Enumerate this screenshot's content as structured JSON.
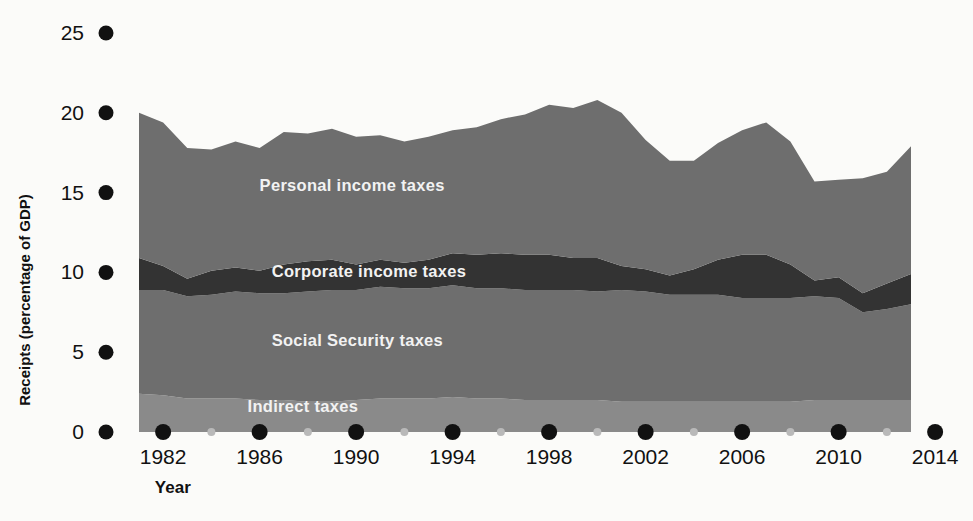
{
  "chart_data": {
    "type": "area",
    "stacked": true,
    "title": "",
    "xlabel": "Year",
    "ylabel": "Receipts (percentage of GDP)",
    "xlim": [
      1981,
      2014
    ],
    "ylim": [
      0,
      25
    ],
    "ytick_values": [
      0,
      5,
      10,
      15,
      20,
      25
    ],
    "ytick_labels": [
      "0",
      "5",
      "10",
      "15",
      "20",
      "25"
    ],
    "xtick_major_values": [
      1982,
      1986,
      1990,
      1994,
      1998,
      2002,
      2006,
      2010,
      2014
    ],
    "xtick_major_labels": [
      "1982",
      "1986",
      "1990",
      "1994",
      "1998",
      "2002",
      "2006",
      "2010",
      "2014"
    ],
    "xtick_minor_values": [
      1984,
      1988,
      1992,
      1996,
      2000,
      2004,
      2008,
      2012
    ],
    "grid": false,
    "legend_position": "inline-labels",
    "tick_style": "dots",
    "x": [
      1981,
      1982,
      1983,
      1984,
      1985,
      1986,
      1987,
      1988,
      1989,
      1990,
      1991,
      1992,
      1993,
      1994,
      1995,
      1996,
      1997,
      1998,
      1999,
      2000,
      2001,
      2002,
      2003,
      2004,
      2005,
      2006,
      2007,
      2008,
      2009,
      2010,
      2011,
      2012,
      2013
    ],
    "series": [
      {
        "name": "Indirect taxes",
        "color": "#8a8a8a",
        "label_x": 1985.5,
        "label_y": 1.25,
        "values": [
          2.4,
          2.3,
          2.1,
          2.1,
          2.1,
          2.0,
          2.0,
          1.9,
          1.9,
          2.0,
          2.1,
          2.1,
          2.1,
          2.2,
          2.1,
          2.1,
          2.0,
          2.0,
          2.0,
          2.0,
          1.9,
          1.9,
          1.9,
          1.9,
          1.9,
          1.9,
          1.9,
          1.9,
          2.0,
          2.0,
          2.0,
          2.0,
          2.0
        ]
      },
      {
        "name": "Social Security taxes",
        "color": "#6e6e6e",
        "label_x": 1986.5,
        "label_y": 5.4,
        "values": [
          6.5,
          6.6,
          6.4,
          6.5,
          6.7,
          6.7,
          6.7,
          6.9,
          7.0,
          6.9,
          7.0,
          6.9,
          6.9,
          7.0,
          6.9,
          6.9,
          6.9,
          6.9,
          6.9,
          6.8,
          7.0,
          6.9,
          6.7,
          6.7,
          6.7,
          6.5,
          6.5,
          6.5,
          6.5,
          6.4,
          5.5,
          5.7,
          6.0
        ]
      },
      {
        "name": "Corporate income taxes",
        "color": "#333333",
        "label_x": 1986.5,
        "label_y": 9.7,
        "values": [
          2.0,
          1.5,
          1.1,
          1.5,
          1.5,
          1.4,
          1.8,
          1.9,
          1.9,
          1.6,
          1.7,
          1.6,
          1.8,
          2.0,
          2.1,
          2.2,
          2.2,
          2.2,
          2.0,
          2.1,
          1.5,
          1.4,
          1.2,
          1.6,
          2.2,
          2.7,
          2.7,
          2.1,
          1.0,
          1.3,
          1.2,
          1.6,
          1.9
        ]
      },
      {
        "name": "Personal income taxes",
        "color": "#6e6e6e",
        "label_x": 1986.0,
        "label_y": 15.1,
        "values": [
          9.1,
          9.0,
          8.2,
          7.6,
          7.9,
          7.7,
          8.3,
          8.0,
          8.2,
          8.0,
          7.8,
          7.6,
          7.7,
          7.7,
          8.0,
          8.4,
          8.8,
          9.4,
          9.4,
          9.9,
          9.6,
          8.1,
          7.2,
          6.8,
          7.3,
          7.8,
          8.3,
          7.7,
          6.2,
          6.1,
          7.2,
          7.0,
          8.0
        ]
      }
    ]
  },
  "axis": {
    "y_title": "Receipts (percentage of GDP)",
    "x_title": "Year"
  }
}
